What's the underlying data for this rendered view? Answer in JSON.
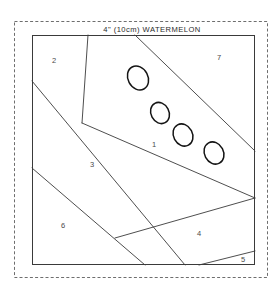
{
  "block": {
    "title": "4\" (10cm) WATERMELON",
    "outline_color": "#3a3a3a",
    "frame_color": "#6e6e6e",
    "seed_color": "#141414",
    "background_color": "#ffffff",
    "label_color": "#4a4a4a"
  },
  "pieces": [
    {
      "id": "1",
      "label": "1",
      "x": 152,
      "y": 147
    },
    {
      "id": "2",
      "label": "2",
      "x": 52,
      "y": 63
    },
    {
      "id": "3",
      "label": "3",
      "x": 90,
      "y": 167
    },
    {
      "id": "4",
      "label": "4",
      "x": 197,
      "y": 236
    },
    {
      "id": "5",
      "label": "5",
      "x": 241,
      "y": 262
    },
    {
      "id": "6",
      "label": "6",
      "x": 61,
      "y": 228
    },
    {
      "id": "7",
      "label": "7",
      "x": 217,
      "y": 60
    }
  ],
  "seeds": [
    {
      "id": "seed-1",
      "cx": 138,
      "cy": 78,
      "rx": 10,
      "ry": 12.5,
      "rotate": -28
    },
    {
      "id": "seed-2",
      "cx": 160,
      "cy": 113,
      "rx": 9,
      "ry": 11,
      "rotate": -28
    },
    {
      "id": "seed-3",
      "cx": 183,
      "cy": 135,
      "rx": 9.5,
      "ry": 11.5,
      "rotate": -28
    },
    {
      "id": "seed-4",
      "cx": 214,
      "cy": 153,
      "rx": 9.5,
      "ry": 11.5,
      "rotate": -28
    }
  ],
  "geometry": {
    "frame": {
      "x": 14,
      "y": 21,
      "width": 254,
      "height": 257
    },
    "block": {
      "x": 32,
      "y": 35,
      "width": 223,
      "height": 230
    },
    "title_position": {
      "x": 152,
      "y": 32
    },
    "seam_lines": [
      {
        "name": "seam-2-1",
        "points": "88,35 82,123"
      },
      {
        "name": "seam-2-3",
        "points": "32,81 185,265"
      },
      {
        "name": "seam-1-7",
        "points": "135,35 255,151"
      },
      {
        "name": "seam-3-6",
        "points": "32,168 145,265"
      },
      {
        "name": "seam-1-4",
        "points": "82,123 255,198"
      },
      {
        "name": "seam-4-6",
        "points": "115,238 255,198"
      },
      {
        "name": "seam-4-5",
        "points": "199,265 255,251"
      }
    ]
  }
}
